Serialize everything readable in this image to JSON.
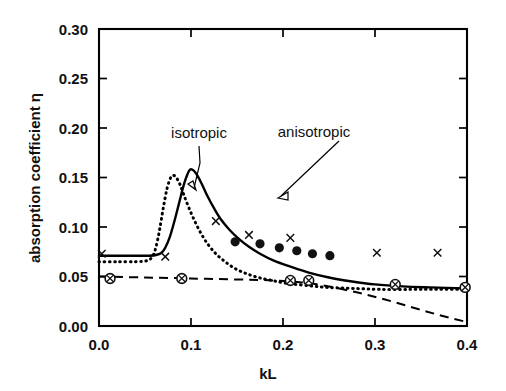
{
  "chart_data": {
    "type": "line",
    "title": "",
    "xlabel": "kL",
    "ylabel": "absorption coefficient η",
    "xlim": [
      0.0,
      0.4
    ],
    "ylim": [
      0.0,
      0.3
    ],
    "xticks": [
      "0.0",
      "0.1",
      "0.2",
      "0.3",
      "0.4"
    ],
    "xtick_values": [
      0.0,
      0.1,
      0.2,
      0.3,
      0.4
    ],
    "yticks": [
      "0.00",
      "0.05",
      "0.10",
      "0.15",
      "0.20",
      "0.25",
      "0.30"
    ],
    "ytick_values": [
      0.0,
      0.05,
      0.1,
      0.15,
      0.2,
      0.25,
      0.3
    ],
    "grid": false,
    "legend_position": "none",
    "annotations": [
      {
        "text": "isotropic",
        "points_to": "dotted-curve",
        "x": 0.105,
        "y": 0.203
      },
      {
        "text": "anisotropic",
        "points_to": "solid-curve",
        "x": 0.205,
        "y": 0.206
      }
    ],
    "series": [
      {
        "name": "anisotropic",
        "style": "solid",
        "x": [
          0.0,
          0.02,
          0.04,
          0.055,
          0.063,
          0.068,
          0.072,
          0.077,
          0.082,
          0.087,
          0.092,
          0.096,
          0.099,
          0.103,
          0.107,
          0.112,
          0.118,
          0.125,
          0.133,
          0.142,
          0.152,
          0.163,
          0.175,
          0.19,
          0.208,
          0.228,
          0.25,
          0.275,
          0.3,
          0.33,
          0.36,
          0.4
        ],
        "y": [
          0.071,
          0.071,
          0.071,
          0.071,
          0.072,
          0.074,
          0.079,
          0.09,
          0.106,
          0.124,
          0.142,
          0.153,
          0.158,
          0.157,
          0.152,
          0.143,
          0.131,
          0.119,
          0.107,
          0.097,
          0.088,
          0.08,
          0.073,
          0.066,
          0.06,
          0.054,
          0.049,
          0.045,
          0.042,
          0.04,
          0.039,
          0.038
        ]
      },
      {
        "name": "isotropic",
        "style": "dotted",
        "x": [
          0.0,
          0.02,
          0.04,
          0.052,
          0.058,
          0.062,
          0.066,
          0.07,
          0.074,
          0.078,
          0.081,
          0.084,
          0.088,
          0.092,
          0.097,
          0.103,
          0.11,
          0.118,
          0.127,
          0.137,
          0.148,
          0.16,
          0.173,
          0.188,
          0.205,
          0.225,
          0.248,
          0.275,
          0.305,
          0.34,
          0.37,
          0.4
        ],
        "y": [
          0.065,
          0.065,
          0.065,
          0.066,
          0.07,
          0.08,
          0.098,
          0.12,
          0.139,
          0.15,
          0.152,
          0.15,
          0.143,
          0.133,
          0.121,
          0.108,
          0.095,
          0.083,
          0.073,
          0.065,
          0.058,
          0.053,
          0.049,
          0.046,
          0.043,
          0.041,
          0.039,
          0.038,
          0.037,
          0.037,
          0.037,
          0.037
        ]
      },
      {
        "name": "baseline",
        "style": "dashed",
        "x": [
          0.0,
          0.05,
          0.1,
          0.15,
          0.19,
          0.22,
          0.25,
          0.28,
          0.31,
          0.34,
          0.37,
          0.4
        ],
        "y": [
          0.05,
          0.049,
          0.048,
          0.047,
          0.046,
          0.044,
          0.04,
          0.034,
          0.027,
          0.019,
          0.011,
          0.004
        ]
      }
    ],
    "scatter_series": [
      {
        "name": "filled-circle-data",
        "marker": "filled-circle",
        "x": [
          0.148,
          0.175,
          0.196,
          0.215,
          0.232,
          0.251
        ],
        "y": [
          0.085,
          0.083,
          0.079,
          0.076,
          0.073,
          0.071
        ]
      },
      {
        "name": "cross-data",
        "marker": "cross",
        "x": [
          0.003,
          0.072,
          0.127,
          0.163,
          0.208,
          0.302,
          0.368
        ],
        "y": [
          0.073,
          0.07,
          0.106,
          0.092,
          0.089,
          0.074,
          0.074
        ]
      },
      {
        "name": "circled-cross-data",
        "marker": "circled-cross",
        "x": [
          0.012,
          0.09,
          0.208,
          0.228,
          0.322,
          0.398
        ],
        "y": [
          0.048,
          0.048,
          0.046,
          0.046,
          0.042,
          0.039
        ]
      }
    ]
  }
}
